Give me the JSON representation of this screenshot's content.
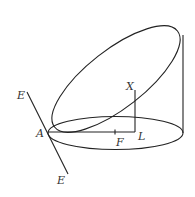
{
  "diagram": {
    "type": "geometry",
    "labels": {
      "E_top": "E",
      "E_bottom": "E",
      "A": "A",
      "X": "X",
      "L": "L",
      "F": "F"
    },
    "colors": {
      "stroke": "#222222",
      "label": "#333333",
      "background": "#ffffff"
    }
  }
}
